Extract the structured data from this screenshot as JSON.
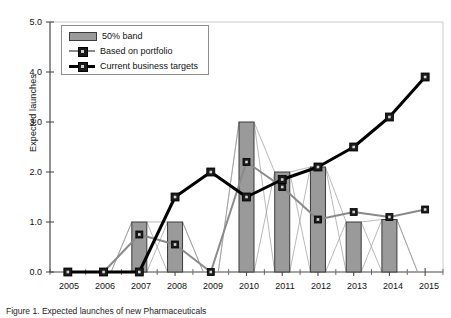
{
  "chart_data": {
    "type": "bar",
    "title": "",
    "xlabel": "",
    "ylabel": "Expected launches",
    "categories": [
      "2005",
      "2006",
      "2007",
      "2008",
      "2009",
      "2010",
      "2011",
      "2012",
      "2013",
      "2014",
      "2015"
    ],
    "ylim": [
      0.0,
      5.0
    ],
    "ytick_labels": [
      "0.0",
      "1.0",
      "2.0",
      "3.0",
      "4.0",
      "5.0"
    ],
    "ytick_values": [
      0.0,
      1.0,
      2.0,
      3.0,
      4.0,
      5.0
    ],
    "grid": false,
    "legend_position": "upper-left-inside",
    "bars": {
      "name": "50% band",
      "values": [
        0,
        0,
        1.0,
        1.0,
        0,
        3.0,
        2.0,
        2.1,
        1.0,
        1.05,
        0
      ],
      "color": "#9a9a9a",
      "edge_color": "#3a3a3a"
    },
    "series": [
      {
        "name": "Based on portfolio",
        "style": "thin-gray-line-square-marker",
        "color": "#8a8a8a",
        "values": [
          0.0,
          0.0,
          0.75,
          0.55,
          0.0,
          2.2,
          1.7,
          1.05,
          1.2,
          1.1,
          1.25
        ]
      },
      {
        "name": "Current business targets",
        "style": "thick-black-line-square-marker",
        "color": "#000000",
        "values": [
          0.0,
          0.0,
          0.0,
          1.5,
          2.0,
          1.5,
          1.85,
          2.1,
          2.5,
          3.1,
          3.9
        ]
      }
    ],
    "band_envelope": {
      "description": "thin connector lines linking bar top/bottom corners between adjacent years",
      "color": "#9b9b9b"
    }
  },
  "legend": {
    "items": [
      {
        "label": "50% band",
        "icon": "bar-swatch"
      },
      {
        "label": "Based on portfolio",
        "icon": "line-square-marker"
      },
      {
        "label": "Current business targets",
        "icon": "line-square-marker-bold"
      }
    ]
  },
  "caption": {
    "text": "Figure 1. Expected launches of new Pharmaceuticals"
  }
}
